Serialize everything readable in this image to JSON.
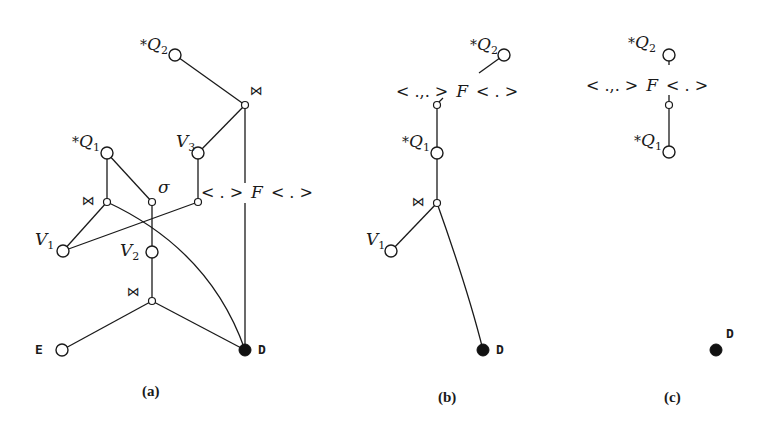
{
  "figure": {
    "panels": [
      {
        "id": "a",
        "caption": "(a)",
        "labels": {
          "q2_star": "*",
          "q2_main": "Q",
          "q2_sub": "2",
          "q1_star": "*",
          "q1_main": "Q",
          "q1_sub": "1",
          "v1_main": "V",
          "v1_sub": "1",
          "v2_main": "V",
          "v2_sub": "2",
          "v3_main": "V",
          "v3_sub": "3",
          "join_top": "⋈",
          "join_mid": "⋈",
          "join_bottom": "⋈",
          "sigma": "σ",
          "f_left": "< . >",
          "f_main": "F",
          "f_right": "< . >",
          "e": "E",
          "d": "D"
        }
      },
      {
        "id": "b",
        "caption": "(b)",
        "labels": {
          "q2_star": "*",
          "q2_main": "Q",
          "q2_sub": "2",
          "q1_star": "*",
          "q1_main": "Q",
          "q1_sub": "1",
          "v1_main": "V",
          "v1_sub": "1",
          "join": "⋈",
          "f_left": "< .,. >",
          "f_main": "F",
          "f_right": "< . >",
          "d": "D"
        }
      },
      {
        "id": "c",
        "caption": "(c)",
        "labels": {
          "q2_star": "*",
          "q2_main": "Q",
          "q2_sub": "2",
          "q1_star": "*",
          "q1_main": "Q",
          "q1_sub": "1",
          "f_left": "< .,. >",
          "f_main": "F",
          "f_right": "< . >",
          "d": "D"
        }
      }
    ]
  }
}
